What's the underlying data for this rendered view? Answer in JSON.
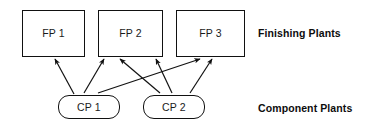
{
  "diagram": {
    "tiers": [
      {
        "id": "finishing",
        "label": "Finishing Plants",
        "label_x": 258,
        "label_y": 28,
        "nodes": [
          {
            "id": "fp1",
            "label": "FP 1",
            "shape": "rectangle",
            "x": 22,
            "y": 10,
            "w": 63,
            "h": 47
          },
          {
            "id": "fp2",
            "label": "FP 2",
            "shape": "rectangle",
            "x": 98,
            "y": 10,
            "w": 65,
            "h": 47
          },
          {
            "id": "fp3",
            "label": "FP 3",
            "shape": "rectangle",
            "x": 176,
            "y": 10,
            "w": 69,
            "h": 47
          }
        ]
      },
      {
        "id": "component",
        "label": "Component Plants",
        "label_x": 258,
        "label_y": 103,
        "nodes": [
          {
            "id": "cp1",
            "label": "CP 1",
            "shape": "rounded",
            "x": 58,
            "y": 95,
            "w": 62,
            "h": 24
          },
          {
            "id": "cp2",
            "label": "CP 2",
            "shape": "rounded",
            "x": 143,
            "y": 95,
            "w": 62,
            "h": 24
          }
        ]
      }
    ],
    "edges": [
      {
        "id": "cp1-fp1",
        "from": "cp1",
        "to": "fp1",
        "x1": 74,
        "y1": 94,
        "x2": 55,
        "y2": 59,
        "arrow": true
      },
      {
        "id": "cp1-fp2a",
        "from": "cp1",
        "to": "fp2",
        "x1": 84,
        "y1": 93,
        "x2": 104,
        "y2": 59,
        "arrow": true
      },
      {
        "id": "cp1-fp3",
        "from": "cp1",
        "to": "fp3",
        "x1": 98,
        "y1": 93,
        "x2": 200,
        "y2": 59,
        "arrow": true
      },
      {
        "id": "cp2-fp2b",
        "from": "cp2",
        "to": "fp2",
        "x1": 160,
        "y1": 93,
        "x2": 120,
        "y2": 59,
        "arrow": true
      },
      {
        "id": "cp2-fp2c",
        "from": "cp2",
        "to": "fp2",
        "x1": 172,
        "y1": 93,
        "x2": 156,
        "y2": 59,
        "arrow": true
      },
      {
        "id": "cp2-fp3",
        "from": "cp2",
        "to": "fp3",
        "x1": 190,
        "y1": 93,
        "x2": 212,
        "y2": 59,
        "arrow": true
      }
    ],
    "colors": {
      "stroke": "#111111",
      "background": "#ffffff",
      "text": "#1a1a1a",
      "label_text": "#0d0d0d"
    }
  }
}
